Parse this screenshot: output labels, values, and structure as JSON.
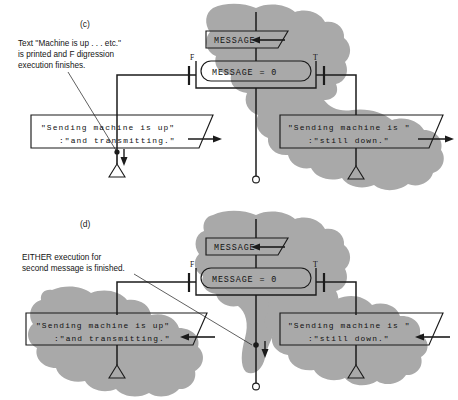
{
  "figure": {
    "type": "flowchart-diagram",
    "background_color": "#ffffff",
    "shade_color": "#a9a9a9",
    "line_color": "#1b1b1b"
  },
  "panels": [
    {
      "id": "c",
      "label": "(c)",
      "annotation": {
        "name": "annotation-c",
        "lines": [
          "Text ''Machine is up . . . etc.''",
          "is printed and F digression",
          "execution finishes."
        ]
      },
      "nodes": {
        "input_box": {
          "label": "MESSAGE",
          "shape": "parallelogram",
          "shaded": true
        },
        "decision": {
          "label": "MESSAGE  =  0",
          "shape": "stadium",
          "shaded": true
        },
        "branch_false_label": "F",
        "branch_true_label": "T",
        "output_left": {
          "shape": "parallelogram",
          "shaded": false,
          "line1": "\"Sending machine is up\"",
          "line2": ":\"and transmitting.\""
        },
        "output_right": {
          "shape": "parallelogram",
          "shaded": true,
          "line1": "\"Sending machine is \"",
          "line2": ":\"still down.\""
        },
        "terminators": [
          "triangle-left",
          "circle-center",
          "triangle-right"
        ]
      }
    },
    {
      "id": "d",
      "label": "(d)",
      "annotation": {
        "name": "annotation-d",
        "lines": [
          "EITHER execution for",
          "second message is finished."
        ]
      },
      "nodes": {
        "input_box": {
          "label": "MESSAGE",
          "shape": "parallelogram",
          "shaded": true
        },
        "decision": {
          "label": "MESSAGE  =  0",
          "shape": "stadium",
          "shaded": true
        },
        "branch_false_label": "F",
        "branch_true_label": "T",
        "output_left": {
          "shape": "parallelogram",
          "shaded": true,
          "line1": "\"Sending machine is up\"",
          "line2": ":\"and transmitting.\""
        },
        "output_right": {
          "shape": "parallelogram",
          "shaded": true,
          "line1": "\"Sending machine is \"",
          "line2": ":\"still down.\""
        },
        "terminators": [
          "triangle-left",
          "circle-center",
          "triangle-right"
        ]
      }
    }
  ]
}
